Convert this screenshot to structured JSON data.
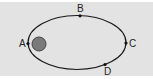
{
  "diagram": {
    "type": "elliptical-orbit",
    "background": "#e3e3e3",
    "orbit": {
      "cx": 77,
      "cy": 42.5,
      "rx": 49,
      "ry": 27,
      "stroke": "#1a1a1a"
    },
    "central_body": {
      "cx": 39,
      "cy": 44,
      "r": 7,
      "fill": "#7a7a7a",
      "stroke": "#444444"
    },
    "points": [
      {
        "id": "A",
        "label": "A",
        "x": 28,
        "y": 43.5,
        "label_x": 19,
        "label_y": 47
      },
      {
        "id": "B",
        "label": "B",
        "x": 80,
        "y": 15.8,
        "label_x": 77,
        "label_y": 12
      },
      {
        "id": "C",
        "label": "C",
        "x": 126,
        "y": 43,
        "label_x": 129,
        "label_y": 47
      },
      {
        "id": "D",
        "label": "D",
        "x": 105,
        "y": 64.5,
        "label_x": 104,
        "label_y": 75
      }
    ]
  }
}
